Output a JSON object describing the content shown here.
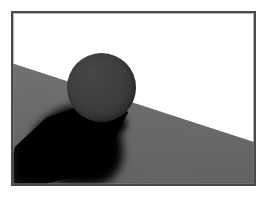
{
  "figure": {
    "kind": "rendered-3d-scene",
    "width": 267,
    "height": 197,
    "alt_text": "Dark sphere resting on a gray inclined plane casting a soft black shadow"
  },
  "frame": {
    "border_color": "#4a4a4a",
    "bevel_color": "#787878",
    "border_width_px": 2,
    "left": 11,
    "top": 11,
    "width": 245,
    "height": 175
  },
  "scene": {
    "background": {
      "name": "sky",
      "color": "#ffffff"
    },
    "ground": {
      "name": "inclined-plane",
      "color_top": "#7d7d7d",
      "color_mid": "#6f6f6f",
      "color_bottom": "#666666",
      "horizon_left_pct": 29.5,
      "horizon_right_pct": 75.5
    },
    "sphere": {
      "name": "sphere",
      "color_light": "#474747",
      "color_mid": "#3f3f3f",
      "color_dark": "#303030",
      "center_x": 88,
      "center_y": 74,
      "diameter": 69
    },
    "shadow": {
      "name": "cast-shadow",
      "color": "#000000",
      "direction": "down-left",
      "softness": "soft-penumbra"
    }
  },
  "chart_data": {
    "type": "scatter",
    "title": "",
    "xlabel": "",
    "ylabel": "",
    "grid": false,
    "legend": "none",
    "annotations": [
      "sphere on inclined plane",
      "soft cast shadow toward lower-left"
    ]
  }
}
